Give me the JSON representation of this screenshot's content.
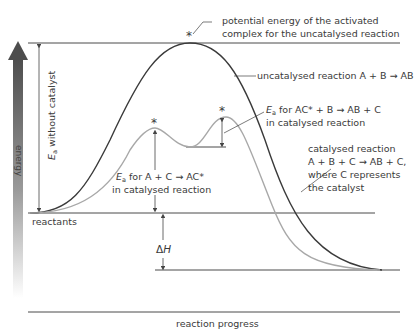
{
  "diagram": {
    "type": "energy-profile",
    "axes": {
      "y_label": "energy",
      "x_label": "reaction progress"
    },
    "annotations": {
      "activated_complex_line1": "potential energy of the activated",
      "activated_complex_line2": "complex for the uncatalysed reaction",
      "uncatalysed_label": "uncatalysed reaction A + B → AB",
      "ea_step2_prefix": "E",
      "ea_step2_sub": "a",
      "ea_step2_line1": " for AC* + B → AB + C",
      "ea_step2_line2": "in catalysed reaction",
      "ea_step1_prefix": "E",
      "ea_step1_sub": "a",
      "ea_step1_line1": " for A + C → AC*",
      "ea_step1_line2": "in catalysed reaction",
      "ea_uncat_prefix": "E",
      "ea_uncat_sub": "a",
      "ea_uncat_text": " without catalyst",
      "catalysed_line1": "catalysed reaction",
      "catalysed_line2": "A + B + C → AB + C,",
      "catalysed_line3": "where C represents",
      "catalysed_line4": "the catalyst",
      "reactants": "reactants",
      "delta_h_symbol": "Δ",
      "delta_h_var": "H",
      "asterisk": "*"
    },
    "colors": {
      "uncatalysed_curve": "#3a3a3a",
      "catalysed_curve": "#a8a8a8",
      "lines": "#4a4a4a",
      "arrow_top": "#4d4d4d",
      "arrow_bottom": "#ffffff"
    }
  }
}
